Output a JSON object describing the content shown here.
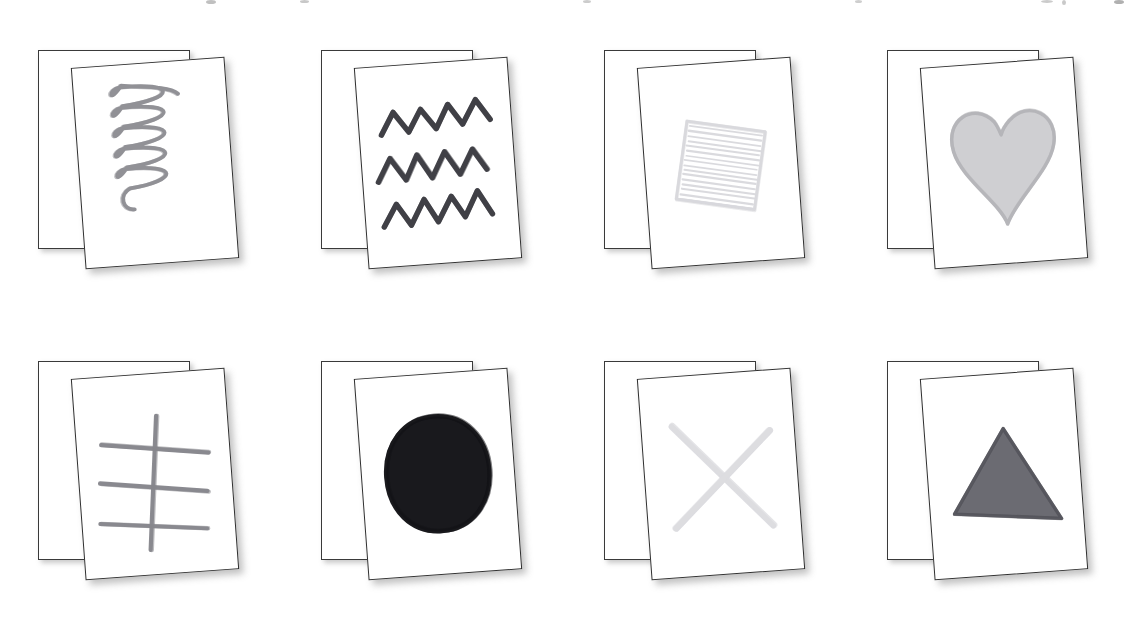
{
  "page": {
    "background_color": "#ffffff",
    "width": 1135,
    "height": 621,
    "grid_columns": 4,
    "grid_rows": 2
  },
  "card_style": {
    "paper_color": "#ffffff",
    "border_color": "#2f2f2f",
    "shadow_color": "#787878",
    "front_rotation_deg": -4.2
  },
  "top_artifacts": [
    {
      "name": "clipped-fragment-1",
      "x": 206,
      "y": 0,
      "w": 10,
      "h": 4,
      "color": "#8c8c8c"
    },
    {
      "name": "clipped-fragment-2",
      "x": 300,
      "y": 0,
      "w": 9,
      "h": 3,
      "color": "#9a9a9a"
    },
    {
      "name": "clipped-fragment-3",
      "x": 583,
      "y": 0,
      "w": 8,
      "h": 3,
      "color": "#a2a2a2"
    },
    {
      "name": "clipped-fragment-4",
      "x": 855,
      "y": 0,
      "w": 7,
      "h": 3,
      "color": "#a6a6a6"
    },
    {
      "name": "clipped-fragment-5",
      "x": 1114,
      "y": 0,
      "w": 10,
      "h": 4,
      "color": "#6f6f6f"
    },
    {
      "name": "clipped-fragment-6",
      "x": 1062,
      "y": 0,
      "w": 4,
      "h": 5,
      "color": "#9c9c9c"
    },
    {
      "name": "clipped-fragment-7",
      "x": 1041,
      "y": 0,
      "w": 12,
      "h": 3,
      "color": "#a0a0a0"
    }
  ],
  "cells": [
    {
      "index": 0,
      "row": 0,
      "column": 0,
      "shape_name": "spiral",
      "shape_label": "Spiral",
      "stroke_color": "#8e8e94",
      "stroke_width": 2.4,
      "fill": "none",
      "darkness": "light",
      "back_card_label": "Spiral (back copy)",
      "front_card_label": "Spiral (front copy)"
    },
    {
      "index": 1,
      "row": 0,
      "column": 1,
      "shape_name": "zigzag-lines",
      "shape_label": "Zigzag lines",
      "stroke_color": "#3c3c42",
      "stroke_width": 3.4,
      "fill": "none",
      "darkness": "dark",
      "back_card_label": "Zigzag lines (back copy)",
      "front_card_label": "Zigzag lines (front copy)"
    },
    {
      "index": 2,
      "row": 0,
      "column": 2,
      "shape_name": "square",
      "shape_label": "Square",
      "stroke_color": "#d8d8dc",
      "stroke_width": 2.0,
      "fill": "none",
      "darkness": "very-light",
      "back_card_label": "Square (back copy)",
      "front_card_label": "Square (front copy)"
    },
    {
      "index": 3,
      "row": 0,
      "column": 3,
      "shape_name": "heart",
      "shape_label": "Heart",
      "stroke_color": "#b4b4b8",
      "stroke_width": 2.0,
      "fill": "#bcbcc0",
      "darkness": "medium-light",
      "back_card_label": "Heart (back copy)",
      "front_card_label": "Heart (front copy)"
    },
    {
      "index": 4,
      "row": 1,
      "column": 0,
      "shape_name": "tally-marks",
      "shape_label": "Tally marks",
      "stroke_color": "#86868c",
      "stroke_width": 2.8,
      "fill": "none",
      "darkness": "light",
      "back_card_label": "Tally marks (back copy)",
      "front_card_label": "Tally marks (front copy)"
    },
    {
      "index": 5,
      "row": 1,
      "column": 1,
      "shape_name": "filled-circle",
      "shape_label": "Filled circle",
      "stroke_color": "#141418",
      "stroke_width": 3.0,
      "fill": "#1a1a1e",
      "darkness": "very-dark",
      "back_card_label": "Filled circle (back copy)",
      "front_card_label": "Filled circle (front copy)"
    },
    {
      "index": 6,
      "row": 1,
      "column": 2,
      "shape_name": "cross-x",
      "shape_label": "Cross (X)",
      "stroke_color": "#dcdce0",
      "stroke_width": 4.0,
      "fill": "none",
      "darkness": "very-light",
      "back_card_label": "Cross (X) (back copy)",
      "front_card_label": "Cross (X) (front copy)"
    },
    {
      "index": 7,
      "row": 1,
      "column": 3,
      "shape_name": "filled-triangle",
      "shape_label": "Filled triangle",
      "stroke_color": "#55555c",
      "stroke_width": 2.2,
      "fill": "#5e5e66",
      "darkness": "dark",
      "back_card_label": "Filled triangle (back copy)",
      "front_card_label": "Filled triangle (front copy)"
    }
  ]
}
